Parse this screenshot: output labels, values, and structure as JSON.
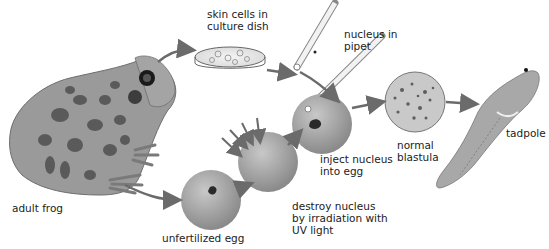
{
  "diagram": {
    "labels": {
      "adult_frog": "adult frog",
      "skin_cells": "skin cells in\nculture dish",
      "nucleus_in_pipet": "nucleus in\npipet",
      "unfertilized_egg": "unfertilized egg",
      "destroy_nucleus": "destroy nucleus\nby irradiation with\nUV light",
      "inject_nucleus": "inject nucleus\ninto egg",
      "normal_blastula": "normal\nblastula",
      "tadpole": "tadpole"
    },
    "colors": {
      "arrow": "#6b6b6b",
      "egg": "#a9a9a9",
      "frog_body": "#9a9a9a",
      "frog_spots": "#5a5a5a",
      "text": "#222222"
    }
  }
}
